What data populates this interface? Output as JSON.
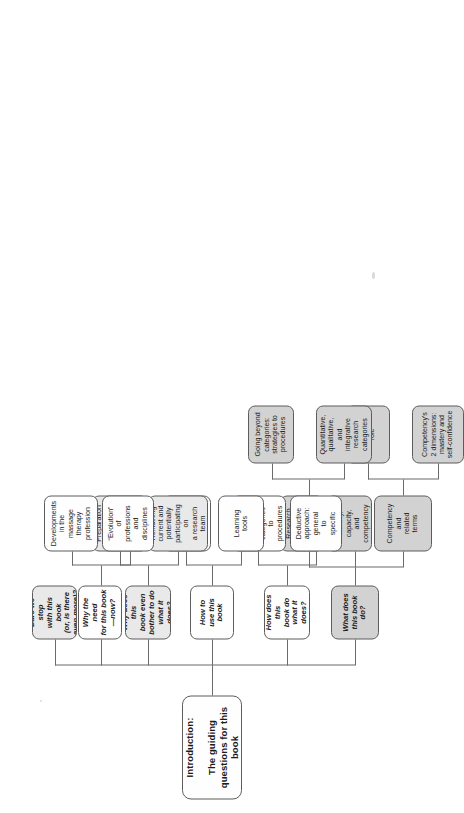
{
  "figure": {
    "title": "Introduction:\nThe guiding questions for this book",
    "title_line1": "Introduction:",
    "title_line2": "The guiding questions for this book",
    "orientation": "landscape figure printed sideways on a portrait page",
    "style": {
      "box_border": "#5d5d5d",
      "connector": "#6b6b6b",
      "fill_white": "#fefefe",
      "fill_light": "#e9e9e9",
      "fill_mid": "#d2d2d2",
      "fill_dark": "#c3c3c3",
      "page_background": "#ffffff"
    }
  },
  "branches": [
    {
      "id": "what-does-this-book-do",
      "label": "What does\nthis book do?",
      "fill": "fill-mid",
      "children": [
        {
          "id": "competency-and-related-terms",
          "label": "Competency\nand\nrelated\nterms",
          "fill": "fill-mid",
          "children": [
            {
              "id": "proficiencys-role",
              "label": "Proficiency's\nrole",
              "fill": "fill-mid"
            },
            {
              "id": "competencys-2-dimensions",
              "label": "Competency's\n2 dimensions:\nmastery and\nself-confidence",
              "fill": "fill-mid"
            }
          ]
        },
        {
          "id": "research-literacy-capacity-competency",
          "label": "Research\nliteracy,\ncapacity,\nand\ncompetency",
          "fill": "fill-mid",
          "children": []
        },
        {
          "id": "research-categories-and-beyond",
          "label": "Research\ncategories\nand\nbeyond",
          "fill": "fill-mid",
          "children": [
            {
              "id": "going-beyond-categories",
              "label": "Going beyond\ncategories:\nstrategies to\nprocedures",
              "fill": "fill-mid"
            },
            {
              "id": "quantitative-qualitative-integrative",
              "label": "Quantitative,\nqualitative,\nand\nintegrative\nresearch\ncategories",
              "fill": "fill-mid"
            }
          ]
        }
      ]
    },
    {
      "id": "how-does-this-book-do-what-it-does",
      "label": "How does this\nbook do\nwhat it does?",
      "fill": "fill-white",
      "children": [
        {
          "id": "deductive-approach-general-to-specific",
          "label": "Deductive\napproach:\ngeneral\nto\nspecific",
          "fill": "fill-white",
          "children": []
        },
        {
          "id": "deductive-approach-illustrated",
          "label": "Deductive\napproach\nillustrated:\ncategories\nto\nprocedures",
          "fill": "fill-white",
          "children": []
        }
      ]
    },
    {
      "id": "how-to-use-this-book",
      "label": "How to\nuse this\nbook",
      "fill": "fill-white",
      "children": [
        {
          "id": "learning-tools",
          "label": "Learning\ntools",
          "fill": "fill-white",
          "children": []
        },
        {
          "id": "basic-and-stretching-topics",
          "label": "Basic and\nstretching\n(intermediate)\ntopics",
          "fill": "fill-white",
          "children": []
        }
      ]
    },
    {
      "id": "why-does-this-book-even-bother",
      "label": "Why does this\nbook even\nbother to do\nwhat it does?",
      "fill": "fill-light",
      "children": [
        {
          "id": "remaining-current-research-team",
          "label": "Remaining\ncurrent and\npotentially\nparticipating\non\na research\nteam",
          "fill": "fill-light",
          "children": []
        },
        {
          "id": "preparation-optimal-professional-care",
          "label": "Preparation\nto provide\noptimal\nprofessional\ncare to\nclients",
          "fill": "fill-light",
          "children": []
        }
      ]
    },
    {
      "id": "why-the-need-for-this-book-now",
      "label": "Why the need\nfor this book\n—now?",
      "fill": "fill-white",
      "children": [
        {
          "id": "evolution-of-professions-and-disciplines",
          "label": "“Evolution”\nof\nprofessions\nand\ndisciplines",
          "fill": "fill-white",
          "children": []
        },
        {
          "id": "developments-in-massage-therapy",
          "label": "Developments\nin the\nmassage\ntherapy\nprofession",
          "fill": "fill-white",
          "children": []
        }
      ]
    },
    {
      "id": "dare-we-stop-with-this-book",
      "label": "Dare we stop\nwith this book\n(or, is there\neven more)?",
      "fill": "fill-light",
      "children": []
    }
  ]
}
